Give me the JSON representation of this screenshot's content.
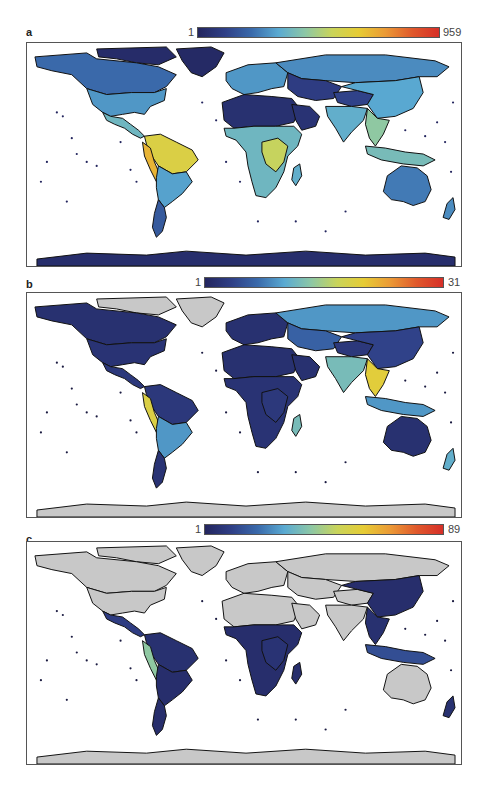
{
  "figure": {
    "colormap": [
      "#23255e",
      "#2f3f86",
      "#3a6aab",
      "#5aaad2",
      "#8cc7a6",
      "#c9d45a",
      "#e6cc35",
      "#eb9a36",
      "#e0592c",
      "#d62f28"
    ],
    "no_data_color": "#c8c8c8",
    "ocean_color": "#ffffff",
    "coastline_color": "#111111"
  },
  "panels": [
    {
      "label": "a",
      "colorbar": {
        "min_label": "1",
        "max_label": "959",
        "min": 1,
        "max": 959
      },
      "region_levels": {
        "greenland": 0.02,
        "arctic_islands": 0.03,
        "alaska_canada": 0.22,
        "usa": 0.3,
        "central_america": 0.38,
        "south_america_north": 0.62,
        "south_america_andes": 0.72,
        "south_america_south": 0.32,
        "patagonia": 0.18,
        "europe": 0.3,
        "siberia": 0.28,
        "central_asia": 0.1,
        "tibet": 0.12,
        "china": 0.33,
        "india": 0.35,
        "se_asia": 0.45,
        "indonesia": 0.4,
        "sahara": 0.05,
        "arabia": 0.06,
        "sub_saharan_africa": 0.38,
        "central_africa": 0.55,
        "madagascar": 0.35,
        "australia": 0.25,
        "new_zealand": 0.28,
        "antarctica": 0.04
      }
    },
    {
      "label": "b",
      "colorbar": {
        "min_label": "1",
        "max_label": "31",
        "min": 1,
        "max": 31
      },
      "region_levels": {
        "greenland": -1,
        "arctic_islands": -1,
        "alaska_canada": 0.05,
        "usa": 0.06,
        "central_america": 0.08,
        "south_america_north": 0.08,
        "south_america_andes": 0.62,
        "south_america_south": 0.3,
        "patagonia": 0.06,
        "europe": 0.05,
        "siberia": 0.3,
        "central_asia": 0.2,
        "tibet": 0.08,
        "china": 0.12,
        "india": 0.4,
        "se_asia": 0.65,
        "indonesia": 0.3,
        "sahara": 0.05,
        "arabia": 0.05,
        "sub_saharan_africa": 0.06,
        "central_africa": 0.08,
        "madagascar": 0.4,
        "australia": 0.05,
        "new_zealand": 0.35,
        "antarctica": -1
      }
    },
    {
      "label": "c",
      "colorbar": {
        "min_label": "1",
        "max_label": "89",
        "min": 1,
        "max": 89
      },
      "region_levels": {
        "greenland": -1,
        "arctic_islands": -1,
        "alaska_canada": -1,
        "usa": -1,
        "central_america": 0.1,
        "south_america_north": 0.05,
        "south_america_andes": 0.45,
        "south_america_south": 0.04,
        "patagonia": 0.04,
        "europe": -1,
        "siberia": -1,
        "central_asia": -1,
        "tibet": -1,
        "china": 0.04,
        "india": -1,
        "se_asia": 0.05,
        "indonesia": 0.15,
        "sahara": -1,
        "arabia": -1,
        "sub_saharan_africa": 0.04,
        "central_africa": 0.06,
        "madagascar": 0.04,
        "australia": -1,
        "new_zealand": 0.05,
        "antarctica": -1
      }
    }
  ]
}
